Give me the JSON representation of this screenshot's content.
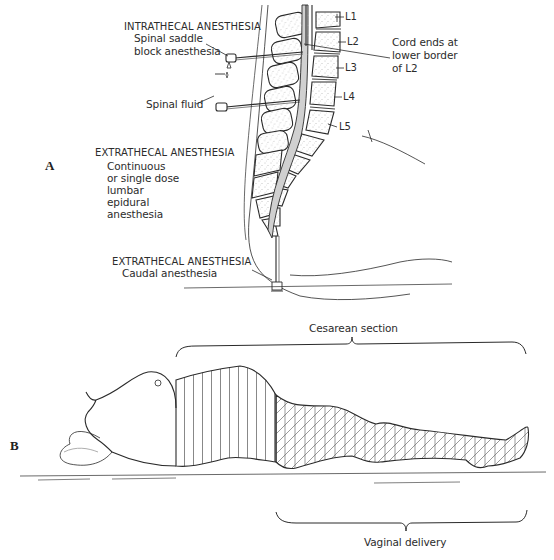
{
  "figure": {
    "panel_a": {
      "letter": "A",
      "intrathecal": {
        "heading": "INTRATHECAL ANESTHESIA",
        "line1": "Spinal saddle",
        "line2": "block anesthesia"
      },
      "spinal_fluid": "Spinal fluid",
      "extrathecal_lumbar": {
        "heading": "EXTRATHECAL ANESTHESIA",
        "line1": "Continuous",
        "line2": "or single dose",
        "line3": "lumbar",
        "line4": "epidural",
        "line5": "anesthesia"
      },
      "extrathecal_caudal": {
        "heading": "EXTRATHECAL ANESTHESIA",
        "line1": "Caudal anesthesia"
      },
      "cord_note": {
        "line1": "Cord ends at",
        "line2": "lower border",
        "line3": "of L2"
      },
      "vertebrae": [
        "L1",
        "L2",
        "L3",
        "L4",
        "L5"
      ]
    },
    "panel_b": {
      "letter": "B",
      "cesarean_label": "Cesarean section",
      "vaginal_label": "Vaginal delivery"
    },
    "colors": {
      "ink": "#2a2a2a",
      "csf_fill": "#cfcfcf",
      "bone_stipple": "#9a9a9a",
      "background": "#ffffff"
    }
  }
}
